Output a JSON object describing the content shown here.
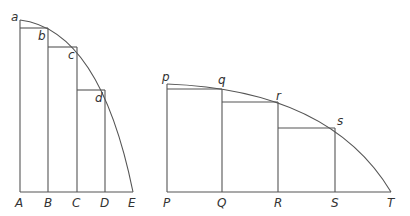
{
  "figure_left": {
    "base_labels": [
      "A",
      "B",
      "C",
      "D",
      "E"
    ],
    "curve_labels": [
      "a",
      "b",
      "c",
      "d"
    ]
  },
  "figure_right": {
    "base_labels": [
      "P",
      "Q",
      "R",
      "S",
      "T"
    ],
    "curve_labels": [
      "p",
      "q",
      "r",
      "s"
    ]
  },
  "colors": {
    "line": "#555555",
    "text": "#333333",
    "background": "#ffffff"
  }
}
